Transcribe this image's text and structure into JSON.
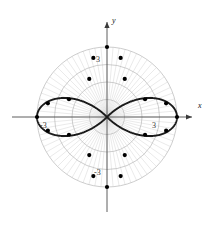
{
  "figure": {
    "title": "",
    "axis_labels": {
      "x": "x",
      "y": "y"
    },
    "tick_labels": {
      "x_positive": "3",
      "x_negative": "-3",
      "y_positive": "3",
      "y_negative": "-3"
    },
    "colors": {
      "curve": "#1a1a1a",
      "grid": "#b8b8b8",
      "spoke": "#d0d0d0",
      "axis": "#4d4d4d",
      "marker": "#000000",
      "background": "#ffffff"
    }
  },
  "chart_data": {
    "type": "line",
    "plot_kind": "polar",
    "title": "",
    "xlabel": "x",
    "ylabel": "y",
    "equation": "r = 3 cos(2θ)",
    "petals": 4,
    "max_radius": 3,
    "radial_ticks": [
      1,
      2,
      3
    ],
    "radial_tick_labels": [
      "3",
      "-3"
    ],
    "grid": true,
    "legend": "none",
    "grid_circles_radii": [
      0.75,
      1.5,
      2.25,
      3.0
    ],
    "spoke_count": 72,
    "petal_tip_angles_deg": [
      0,
      90,
      180,
      270
    ],
    "marker_points_polar": [
      {
        "r": 3.0,
        "theta_deg": 0
      },
      {
        "r": 2.6,
        "theta_deg": 13
      },
      {
        "r": 2.6,
        "theta_deg": -13
      },
      {
        "r": 1.8,
        "theta_deg": 25
      },
      {
        "r": 1.8,
        "theta_deg": -25
      },
      {
        "r": 3.0,
        "theta_deg": 90
      },
      {
        "r": 2.6,
        "theta_deg": 103
      },
      {
        "r": 2.6,
        "theta_deg": 77
      },
      {
        "r": 1.8,
        "theta_deg": 115
      },
      {
        "r": 1.8,
        "theta_deg": 65
      },
      {
        "r": 3.0,
        "theta_deg": 180
      },
      {
        "r": 2.6,
        "theta_deg": 193
      },
      {
        "r": 2.6,
        "theta_deg": 167
      },
      {
        "r": 1.8,
        "theta_deg": 205
      },
      {
        "r": 1.8,
        "theta_deg": 155
      },
      {
        "r": 3.0,
        "theta_deg": 270
      },
      {
        "r": 2.6,
        "theta_deg": 283
      },
      {
        "r": 2.6,
        "theta_deg": 257
      },
      {
        "r": 1.8,
        "theta_deg": 295
      },
      {
        "r": 1.8,
        "theta_deg": 245
      }
    ],
    "x": [],
    "values": [],
    "xlim": [
      -3.6,
      3.6
    ],
    "ylim": [
      -3.6,
      3.6
    ]
  }
}
